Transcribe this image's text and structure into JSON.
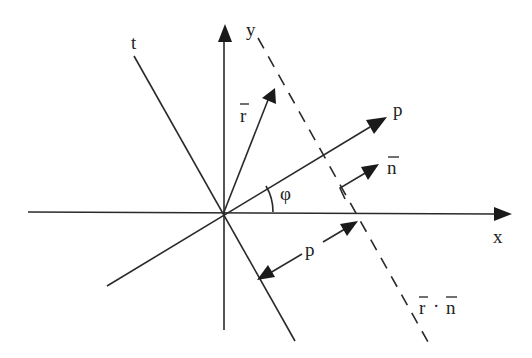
{
  "diagram": {
    "labels": {
      "x_axis": "x",
      "y_axis": "y",
      "t_axis": "t",
      "p_axis": "p",
      "r_vector": "r",
      "n_vector": "n",
      "angle": "φ",
      "distance": "p",
      "line_r": "r",
      "line_dot": "·",
      "line_n": "n"
    },
    "colors": {
      "stroke": "#2a2a2a",
      "background": "#ffffff"
    }
  }
}
